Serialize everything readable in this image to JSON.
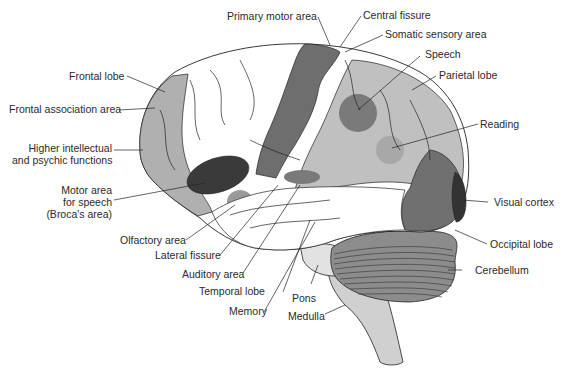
{
  "diagram": {
    "type": "brain-lateral-view",
    "colors": {
      "white_matter": "#ffffff",
      "light_region": "#bcbcbc",
      "medium_region": "#9a9a9a",
      "dark_region": "#6e6e6e",
      "darkest_region": "#3a3a3a",
      "brainstem": "#d0d0d0",
      "outline": "#222222"
    },
    "labels": {
      "primary_motor_area": "Primary motor area",
      "central_fissure": "Central fissure",
      "somatic_sensory_area": "Somatic sensory area",
      "speech": "Speech",
      "parietal_lobe": "Parietal lobe",
      "frontal_lobe": "Frontal lobe",
      "frontal_association_area": "Frontal association area",
      "higher_intellectual_1": "Higher intellectual",
      "higher_intellectual_2": "and psychic functions",
      "reading": "Reading",
      "motor_speech_1": "Motor area",
      "motor_speech_2": "for speech",
      "motor_speech_3": "(Broca's area)",
      "visual_cortex": "Visual cortex",
      "olfactory_area": "Olfactory area",
      "lateral_fissure": "Lateral fissure",
      "occipital_lobe": "Occipital lobe",
      "cerebellum": "Cerebellum",
      "auditory_area": "Auditory area",
      "temporal_lobe": "Temporal lobe",
      "pons": "Pons",
      "memory": "Memory",
      "medulla": "Medulla"
    }
  }
}
